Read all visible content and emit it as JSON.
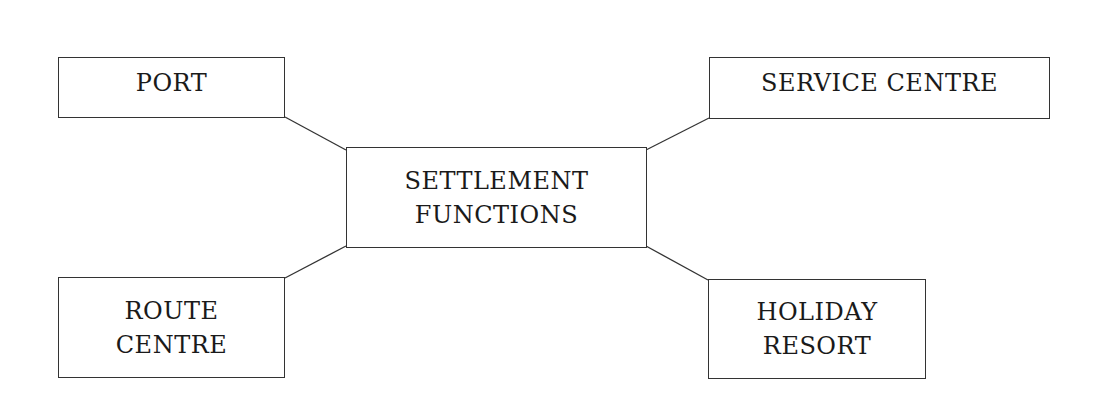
{
  "diagram": {
    "center": {
      "lines": [
        "SETTLEMENT",
        "FUNCTIONS"
      ]
    },
    "nodes": {
      "port": {
        "lines": [
          "PORT"
        ]
      },
      "service_centre": {
        "lines": [
          "SERVICE CENTRE"
        ]
      },
      "route_centre": {
        "lines": [
          "ROUTE",
          "CENTRE"
        ]
      },
      "holiday_resort": {
        "lines": [
          "HOLIDAY",
          "RESORT"
        ]
      }
    },
    "edges": [
      {
        "from": "port",
        "to": "center"
      },
      {
        "from": "service_centre",
        "to": "center"
      },
      {
        "from": "route_centre",
        "to": "center"
      },
      {
        "from": "holiday_resort",
        "to": "center"
      }
    ],
    "colors": {
      "stroke": "#333333",
      "text": "#1a1a1a",
      "background": "#ffffff"
    }
  }
}
